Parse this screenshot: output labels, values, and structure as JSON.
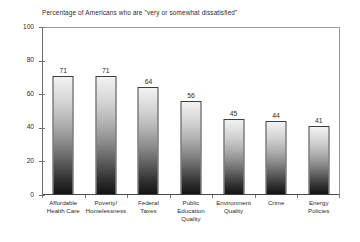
{
  "chart_data": {
    "type": "bar",
    "title": "Percentage of Americans who are \"very or somewhat dissatisfied\"",
    "xlabel": "",
    "ylabel": "",
    "ylim": [
      0,
      100
    ],
    "yticks": [
      0,
      20,
      40,
      60,
      80,
      100
    ],
    "grid": false,
    "legend": false,
    "categories": [
      "Affordable Health Care",
      "Poverty/ Homelessness",
      "Federal Taxes",
      "Public Education Quality",
      "Environment Quality",
      "Crime",
      "Energy Policies"
    ],
    "category_lines": [
      [
        "Affordable",
        "Health Care"
      ],
      [
        "Poverty/",
        "Homelessness"
      ],
      [
        "Federal",
        "Taxes"
      ],
      [
        "Public",
        "Education",
        "Quality"
      ],
      [
        "Environment",
        "Quality"
      ],
      [
        "Crime"
      ],
      [
        "Energy",
        "Policies"
      ]
    ],
    "values": [
      71,
      71,
      64,
      56,
      45,
      44,
      41
    ],
    "value_labels": [
      "71",
      "71",
      "64",
      "56",
      "45",
      "44",
      "41"
    ],
    "bar_style": {
      "fill": "vertical-gradient-light-to-dark",
      "top_color": "#f2f2f2",
      "bottom_color": "#141414",
      "border_color": "#3d3d3d"
    },
    "axis_color": "#6b6b6b",
    "text_color": "#2b2b2b",
    "background": "#ffffff"
  }
}
